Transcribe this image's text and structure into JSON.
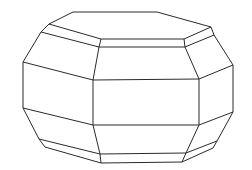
{
  "figure": {
    "stroke_color": "#2a2a2a",
    "background": "#ffffff",
    "edges": [
      [
        73,
        12,
        157,
        12
      ],
      [
        157,
        12,
        211,
        27
      ],
      [
        211,
        27,
        184,
        39
      ],
      [
        184,
        39,
        101,
        39
      ],
      [
        101,
        39,
        49,
        24
      ],
      [
        49,
        24,
        73,
        12
      ],
      [
        49,
        24,
        41,
        32
      ],
      [
        41,
        32,
        99,
        47
      ],
      [
        99,
        47,
        101,
        39
      ],
      [
        99,
        47,
        185,
        47
      ],
      [
        185,
        47,
        184,
        39
      ],
      [
        185,
        47,
        214,
        35
      ],
      [
        214,
        35,
        211,
        27
      ],
      [
        41,
        32,
        23,
        62
      ],
      [
        23,
        62,
        93,
        80
      ],
      [
        93,
        80,
        99,
        47
      ],
      [
        93,
        80,
        199,
        79
      ],
      [
        199,
        79,
        185,
        47
      ],
      [
        199,
        79,
        233,
        65
      ],
      [
        233,
        65,
        214,
        35
      ],
      [
        23,
        62,
        23,
        108
      ],
      [
        93,
        80,
        93,
        125
      ],
      [
        199,
        79,
        199,
        125
      ],
      [
        233,
        65,
        233,
        112
      ],
      [
        23,
        108,
        93,
        125
      ],
      [
        93,
        125,
        199,
        125
      ],
      [
        199,
        125,
        233,
        112
      ],
      [
        23,
        108,
        39,
        139
      ],
      [
        39,
        139,
        100,
        154
      ],
      [
        100,
        154,
        93,
        125
      ],
      [
        100,
        154,
        186,
        153
      ],
      [
        186,
        153,
        199,
        125
      ],
      [
        186,
        153,
        217,
        141
      ],
      [
        217,
        141,
        233,
        112
      ],
      [
        39,
        139,
        45,
        147
      ],
      [
        45,
        147,
        101,
        163
      ],
      [
        101,
        163,
        100,
        154
      ],
      [
        101,
        163,
        182,
        162
      ],
      [
        182,
        162,
        186,
        153
      ],
      [
        182,
        162,
        213,
        148
      ],
      [
        213,
        148,
        217,
        141
      ]
    ]
  }
}
